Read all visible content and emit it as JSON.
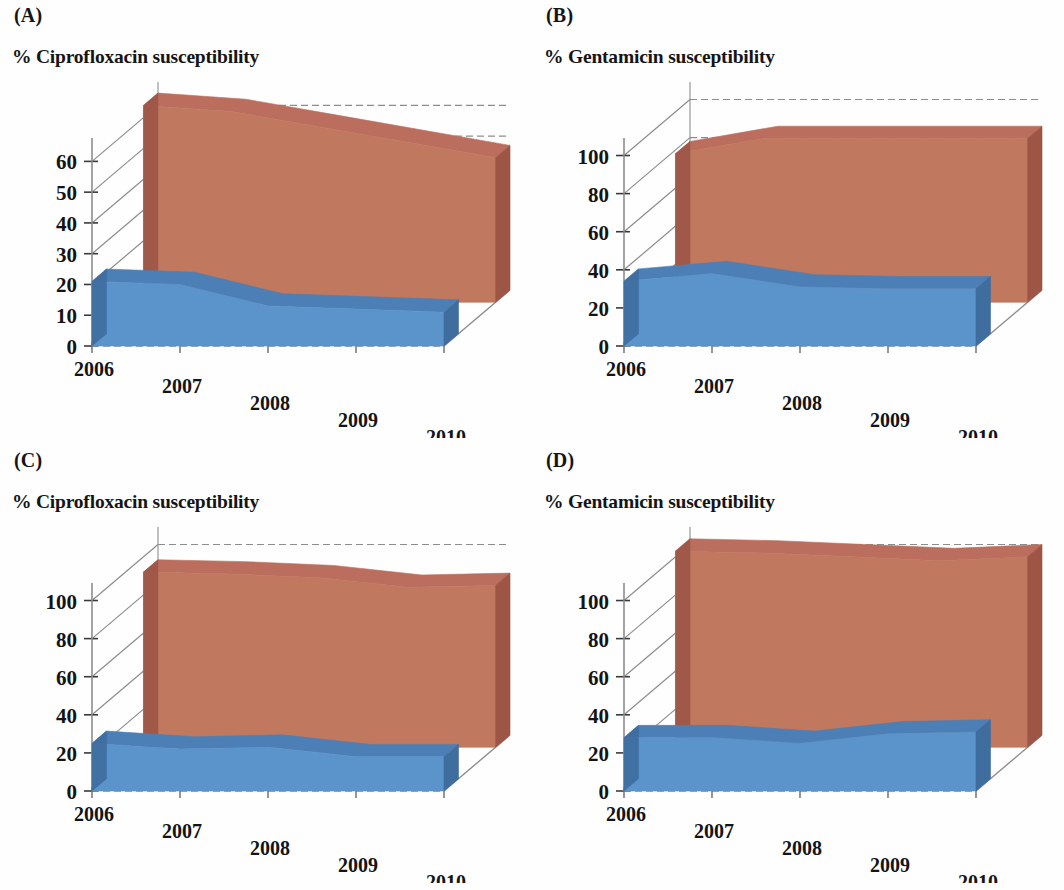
{
  "figure": {
    "panels": [
      {
        "letter": "(A)",
        "title": "% Ciprofloxacin susceptibility",
        "xlabel": "Year",
        "yticks": [
          "0",
          "10",
          "20",
          "30",
          "40",
          "50",
          "60"
        ],
        "xticks": [
          "2006",
          "2007",
          "2008",
          "2009",
          "2010"
        ]
      },
      {
        "letter": "(B)",
        "title": "% Gentamicin susceptibility",
        "xlabel": "Year",
        "yticks": [
          "0",
          "20",
          "40",
          "60",
          "80",
          "100"
        ],
        "xticks": [
          "2006",
          "2007",
          "2008",
          "2009",
          "2010"
        ]
      },
      {
        "letter": "(C)",
        "title": "% Ciprofloxacin susceptibility",
        "xlabel": "",
        "yticks": [
          "0",
          "20",
          "40",
          "60",
          "80",
          "100"
        ],
        "xticks": [
          "2006",
          "2007",
          "2008",
          "2009",
          "2010"
        ]
      },
      {
        "letter": "(D)",
        "title": "% Gentamicin susceptibility",
        "xlabel": "",
        "yticks": [
          "0",
          "20",
          "40",
          "60",
          "80",
          "100"
        ],
        "xticks": [
          "2006",
          "2007",
          "2008",
          "2009",
          "2010"
        ]
      }
    ]
  },
  "colors": {
    "red_top": "#bb6e5d",
    "red_face": "#c0785f",
    "red_side": "#9d5546",
    "blue_top": "#4b7fb5",
    "blue_face": "#5b93cb",
    "blue_side": "#3f6d9e",
    "axis": "#8d8d8d",
    "text": "#141414",
    "background": "#fefefe"
  },
  "chart_data": [
    {
      "panel": "A",
      "type": "area",
      "title": "% Ciprofloxacin susceptibility",
      "xlabel": "Year",
      "ylabel": "% Ciprofloxacin susceptibility",
      "categories": [
        "2006",
        "2007",
        "2008",
        "2009",
        "2010"
      ],
      "ylim": [
        0,
        65
      ],
      "ytick_values": [
        0,
        10,
        20,
        30,
        40,
        50,
        60
      ],
      "grid": true,
      "legend": "none",
      "series": [
        {
          "name": "red-series",
          "color": "#c0785f",
          "values": [
            64,
            62,
            57,
            52,
            47
          ]
        },
        {
          "name": "blue-series",
          "color": "#5b93cb",
          "values": [
            21,
            20,
            13,
            12,
            11
          ]
        }
      ]
    },
    {
      "panel": "B",
      "type": "area",
      "title": "% Gentamicin susceptibility",
      "xlabel": "Year",
      "ylabel": "% Gentamicin susceptibility",
      "categories": [
        "2006",
        "2007",
        "2008",
        "2009",
        "2010"
      ],
      "ylim": [
        0,
        105
      ],
      "ytick_values": [
        0,
        20,
        40,
        60,
        80,
        100
      ],
      "grid": true,
      "legend": "none",
      "series": [
        {
          "name": "red-series",
          "color": "#c0785f",
          "values": [
            78,
            86,
            86,
            86,
            86
          ]
        },
        {
          "name": "blue-series",
          "color": "#5b93cb",
          "values": [
            34,
            38,
            31,
            30,
            30
          ]
        }
      ]
    },
    {
      "panel": "C",
      "type": "area",
      "title": "% Ciprofloxacin susceptibility",
      "xlabel": "",
      "ylabel": "% Ciprofloxacin susceptibility",
      "categories": [
        "2006",
        "2007",
        "2008",
        "2009",
        "2010"
      ],
      "ylim": [
        0,
        105
      ],
      "ytick_values": [
        0,
        20,
        40,
        60,
        80,
        100
      ],
      "grid": true,
      "legend": "none",
      "series": [
        {
          "name": "red-series",
          "color": "#c0785f",
          "values": [
            92,
            91,
            89,
            84,
            85
          ]
        },
        {
          "name": "blue-series",
          "color": "#5b93cb",
          "values": [
            25,
            22,
            23,
            18,
            18
          ]
        }
      ]
    },
    {
      "panel": "D",
      "type": "area",
      "title": "% Gentamicin susceptibility",
      "xlabel": "",
      "ylabel": "% Gentamicin susceptibility",
      "categories": [
        "2006",
        "2007",
        "2008",
        "2009",
        "2010"
      ],
      "ylim": [
        0,
        105
      ],
      "ytick_values": [
        0,
        20,
        40,
        60,
        80,
        100
      ],
      "grid": true,
      "legend": "none",
      "series": [
        {
          "name": "red-series",
          "color": "#c0785f",
          "values": [
            103,
            102,
            100,
            98,
            100
          ]
        },
        {
          "name": "blue-series",
          "color": "#5b93cb",
          "values": [
            28,
            28,
            25,
            30,
            31
          ]
        }
      ]
    }
  ]
}
